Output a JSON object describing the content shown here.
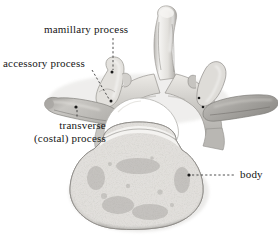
{
  "figure": {
    "view": "superior view",
    "width": 278,
    "height": 238,
    "background_color": "#ffffff",
    "text_color": "#161616",
    "leader_line_color": "#3a3a3a"
  },
  "labels": [
    {
      "id": "mamillary-process",
      "text": "mamillary process",
      "lines": [
        "mamillary process"
      ],
      "x": 44,
      "y": 23,
      "leader": {
        "type": "dashed",
        "x1": 113,
        "y1": 38,
        "x2": 113,
        "y2": 71
      },
      "anchor": {
        "x": 112,
        "y": 72
      }
    },
    {
      "id": "accessory-process",
      "text": "accessory process",
      "lines": [
        "accessory process"
      ],
      "x": 3,
      "y": 57,
      "leader": {
        "type": "dashed",
        "x1": 92,
        "y1": 70,
        "x2": 110,
        "y2": 100
      },
      "anchor": {
        "x": 111,
        "y": 101
      }
    },
    {
      "id": "transverse-costal-process",
      "text": "transverse (costal) process",
      "lines": [
        "transverse",
        "(costal) process"
      ],
      "x": 34,
      "y": 119,
      "leader": {
        "type": "dashed",
        "x1": 77,
        "y1": 110,
        "x2": 77,
        "y2": 117
      },
      "anchor": {
        "x": 76,
        "y": 107
      }
    },
    {
      "id": "body",
      "text": "body",
      "lines": [
        "body"
      ],
      "x": 240,
      "y": 168,
      "leader": {
        "type": "dashed",
        "x1": 192,
        "y1": 175,
        "x2": 236,
        "y2": 175
      },
      "anchor": {
        "x": 189,
        "y": 175
      }
    }
  ],
  "structures": {
    "spinous_process": "spinous process",
    "vertebral_foramen": "vertebral foramen",
    "vertebral_body": "vertebral body",
    "left_transverse_process": "left transverse process",
    "right_transverse_process": "right transverse process",
    "superior_articular_process": "superior articular process",
    "pedicle": "pedicle",
    "lamina": "lamina"
  },
  "palette": {
    "bone_light": "#f2f1ef",
    "bone_mid": "#d8d6d2",
    "bone_shadow": "#a9a7a3",
    "bone_dark": "#8a8885",
    "outline": "#7d7b77",
    "foramen": "#ffffff",
    "speckle": "#9a9894"
  }
}
